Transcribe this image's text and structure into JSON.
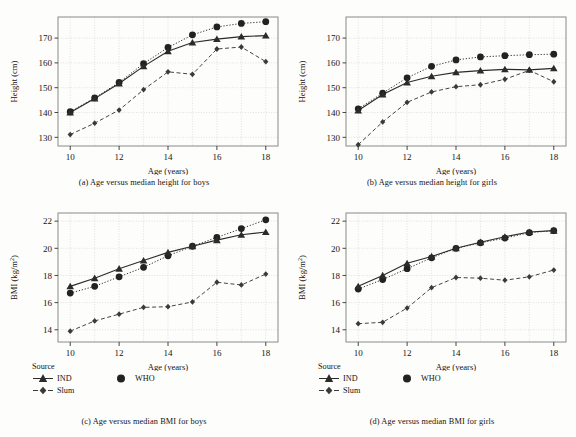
{
  "figure": {
    "legend_title": "Source",
    "series_names": [
      "IND",
      "Slum",
      "WHO"
    ],
    "colors": {
      "ind": "#2b2b2b",
      "slum": "#3a3a3a",
      "who": "#222222",
      "grid": "#cfcfcf",
      "frame": "#8a8a8a"
    },
    "markers": {
      "ind": "triangle",
      "slum": "diamond",
      "who": "circle"
    }
  },
  "panels": {
    "a": {
      "caption": "(a)  Age versus median height for boys",
      "xlabel": "Age (years)",
      "ylabel": "Height (cm)"
    },
    "b": {
      "caption": "(b)  Age versus median height for girls",
      "xlabel": "Age (years)",
      "ylabel": "Height (cm)"
    },
    "c": {
      "caption": "(c)  Age versus median BMI for boys",
      "xlabel": "Age (years)",
      "ylabel_main": "BMI (kg/m",
      "ylabel_sup": "2",
      "ylabel_end": ")"
    },
    "d": {
      "caption": "(d)  Age versus median BMI for girls",
      "xlabel": "Age (years)",
      "ylabel_main": "BMI (kg/m",
      "ylabel_sup": "2",
      "ylabel_end": ")"
    }
  },
  "chart_data": [
    {
      "id": "a",
      "type": "line",
      "title": "(a)  Age versus median height for boys",
      "xlabel": "Age (years)",
      "ylabel": "Height (cm)",
      "x": [
        10,
        11,
        12,
        13,
        14,
        15,
        16,
        17,
        18
      ],
      "xticks": [
        10,
        12,
        14,
        16,
        18
      ],
      "yticks": [
        130,
        140,
        150,
        160,
        170
      ],
      "xlim": [
        9.5,
        18.5
      ],
      "ylim": [
        126.5,
        178.5
      ],
      "grid": true,
      "legend_position": "below-figure",
      "series": [
        {
          "name": "IND",
          "marker": "triangle",
          "linestyle": "solid",
          "values": [
            140.0,
            145.6,
            151.7,
            158.6,
            164.7,
            168.2,
            169.6,
            170.6,
            171.0
          ]
        },
        {
          "name": "Slum",
          "marker": "diamond",
          "linestyle": "dashed",
          "values": [
            131.1,
            135.7,
            141.0,
            149.2,
            156.4,
            155.4,
            165.6,
            166.4,
            160.5
          ]
        },
        {
          "name": "WHO",
          "marker": "circle",
          "linestyle": "dotted",
          "values": [
            140.3,
            145.9,
            152.1,
            159.7,
            166.2,
            171.3,
            174.5,
            175.9,
            176.6
          ]
        }
      ]
    },
    {
      "id": "b",
      "type": "line",
      "title": "(b)  Age versus median height for girls",
      "xlabel": "Age (years)",
      "ylabel": "Height (cm)",
      "x": [
        10,
        11,
        12,
        13,
        14,
        15,
        16,
        17,
        18
      ],
      "xticks": [
        10,
        12,
        14,
        16,
        18
      ],
      "yticks": [
        130,
        140,
        150,
        160,
        170
      ],
      "xlim": [
        9.5,
        18.5
      ],
      "ylim": [
        126.5,
        178.5
      ],
      "grid": true,
      "legend_position": "below-figure",
      "series": [
        {
          "name": "IND",
          "marker": "triangle",
          "linestyle": "solid",
          "values": [
            140.8,
            147.3,
            152.1,
            154.6,
            156.2,
            156.9,
            157.4,
            157.2,
            157.8
          ]
        },
        {
          "name": "Slum",
          "marker": "diamond",
          "linestyle": "dashed",
          "values": [
            127.0,
            136.2,
            144.1,
            148.3,
            150.4,
            151.2,
            153.4,
            157.0,
            152.4
          ]
        },
        {
          "name": "WHO",
          "marker": "circle",
          "linestyle": "dotted",
          "values": [
            141.5,
            147.8,
            154.0,
            158.6,
            161.2,
            162.4,
            162.9,
            163.3,
            163.5
          ]
        }
      ]
    },
    {
      "id": "c",
      "type": "line",
      "title": "(c)  Age versus median BMI for boys",
      "xlabel": "Age (years)",
      "ylabel": "BMI (kg/m2)",
      "x": [
        10,
        11,
        12,
        13,
        14,
        15,
        16,
        17,
        18
      ],
      "xticks": [
        10,
        12,
        14,
        16,
        18
      ],
      "yticks": [
        14,
        16,
        18,
        20,
        22
      ],
      "xlim": [
        9.5,
        18.5
      ],
      "ylim": [
        13.1,
        22.6
      ],
      "grid": true,
      "legend_position": "below-figure",
      "series": [
        {
          "name": "IND",
          "marker": "triangle",
          "linestyle": "solid",
          "values": [
            17.2,
            17.8,
            18.5,
            19.1,
            19.7,
            20.15,
            20.6,
            21.0,
            21.2
          ]
        },
        {
          "name": "Slum",
          "marker": "diamond",
          "linestyle": "dashed",
          "values": [
            13.9,
            14.65,
            15.15,
            15.65,
            15.7,
            16.05,
            17.5,
            17.3,
            18.1
          ]
        },
        {
          "name": "WHO",
          "marker": "circle",
          "linestyle": "dotted",
          "values": [
            16.7,
            17.2,
            17.9,
            18.6,
            19.45,
            20.15,
            20.8,
            21.45,
            22.1
          ]
        }
      ]
    },
    {
      "id": "d",
      "type": "line",
      "title": "(d)  Age versus median BMI for girls",
      "xlabel": "Age (years)",
      "ylabel": "BMI (kg/m2)",
      "x": [
        10,
        11,
        12,
        13,
        14,
        15,
        16,
        17,
        18
      ],
      "xticks": [
        10,
        12,
        14,
        16,
        18
      ],
      "yticks": [
        14,
        16,
        18,
        20,
        22
      ],
      "xlim": [
        9.5,
        18.5
      ],
      "ylim": [
        13.1,
        22.6
      ],
      "grid": true,
      "legend_position": "below-figure",
      "series": [
        {
          "name": "IND",
          "marker": "triangle",
          "linestyle": "solid",
          "values": [
            17.2,
            18.0,
            18.9,
            19.4,
            20.0,
            20.45,
            20.85,
            21.2,
            21.3
          ]
        },
        {
          "name": "Slum",
          "marker": "diamond",
          "linestyle": "dashed",
          "values": [
            14.45,
            14.55,
            15.6,
            17.1,
            17.85,
            17.8,
            17.65,
            17.9,
            18.4
          ]
        },
        {
          "name": "WHO",
          "marker": "circle",
          "linestyle": "dotted",
          "values": [
            17.0,
            17.7,
            18.5,
            19.3,
            20.0,
            20.4,
            20.75,
            21.15,
            21.3
          ]
        }
      ]
    }
  ]
}
